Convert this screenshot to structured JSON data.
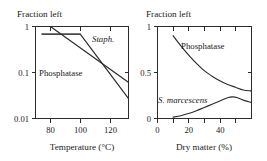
{
  "figure": {
    "panels": [
      {
        "id": "left",
        "top_label": "Fraction left",
        "xlabel": "Temperature (°C)",
        "ylabel": "",
        "yscale": "log",
        "xticks": [
          80,
          100,
          120
        ],
        "xtick_labels": [
          "80",
          "100",
          "120"
        ],
        "yticks": [
          1,
          0.1,
          0.01
        ],
        "ytick_labels": [
          "1",
          "0.1",
          "0.01"
        ],
        "xlim": [
          70,
          132
        ],
        "ylim": [
          0.01,
          1
        ],
        "series": [
          {
            "name": "Phosphatase",
            "label": "Phosphatase",
            "style": "upright",
            "points": [
              [
                74,
                0.68
              ],
              [
                100,
                0.68
              ],
              [
                132,
                0.028
              ]
            ]
          },
          {
            "name": "Staph.",
            "label": "Staph.",
            "style": "italic",
            "points": [
              [
                80,
                1.0
              ],
              [
                132,
                0.062
              ]
            ]
          }
        ]
      },
      {
        "id": "right",
        "top_label": "Fraction left",
        "xlabel": "Dry matter (%)",
        "ylabel": "",
        "yscale": "linear",
        "xticks": [
          0,
          20,
          40
        ],
        "xtick_labels": [
          "0",
          "20",
          "40"
        ],
        "xminorticks": [
          10,
          30,
          50
        ],
        "yticks": [
          1,
          0.5,
          0
        ],
        "ytick_labels": [
          "1",
          "0.5",
          "0"
        ],
        "xlim": [
          0,
          60
        ],
        "ylim": [
          0,
          1
        ],
        "series": [
          {
            "name": "Phosphatase",
            "label": "Phosphatase",
            "style": "upright",
            "points": [
              [
                10,
                0.9
              ],
              [
                15,
                0.79
              ],
              [
                20,
                0.69
              ],
              [
                25,
                0.6
              ],
              [
                30,
                0.52
              ],
              [
                35,
                0.46
              ],
              [
                40,
                0.41
              ],
              [
                45,
                0.37
              ],
              [
                50,
                0.34
              ],
              [
                55,
                0.31
              ],
              [
                60,
                0.3
              ]
            ]
          },
          {
            "name": "S. marcescens",
            "label": "S. marcescens",
            "style": "italic",
            "points": [
              [
                10,
                0.015
              ],
              [
                15,
                0.03
              ],
              [
                20,
                0.055
              ],
              [
                25,
                0.085
              ],
              [
                30,
                0.12
              ],
              [
                35,
                0.155
              ],
              [
                40,
                0.19
              ],
              [
                45,
                0.225
              ],
              [
                48,
                0.235
              ],
              [
                51,
                0.228
              ],
              [
                55,
                0.2
              ],
              [
                60,
                0.175
              ]
            ]
          }
        ]
      }
    ],
    "colors": {
      "axis": "#2b2b2b",
      "curve": "#2b2b2b",
      "curve_thick": "#4a4a4a",
      "text": "#1a1a1a",
      "background": "#ffffff"
    }
  }
}
